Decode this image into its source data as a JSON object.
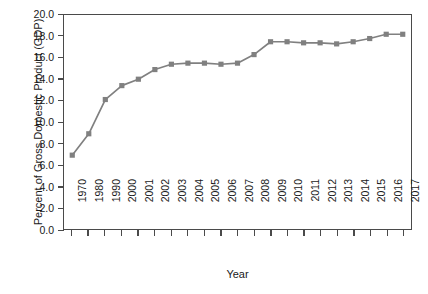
{
  "chart_data": {
    "type": "line",
    "title": "",
    "xlabel": "Year",
    "ylabel": "Percent of Gross Domestic Product (GDP)",
    "ylim": [
      0.0,
      20.0
    ],
    "ytick_step": 2.0,
    "ytick_labels": [
      "20.0",
      "18.0",
      "16.0",
      "14.0",
      "12.0",
      "10.0",
      "8.0",
      "6.0",
      "4.0",
      "2.0",
      "0.0"
    ],
    "grid": false,
    "legend": "none",
    "marker": "square",
    "series_color": "#808080",
    "axis_color": "#4a4a4a",
    "categories": [
      "1970",
      "1980",
      "1990",
      "2000",
      "2001",
      "2002",
      "2003",
      "2004",
      "2005",
      "2006",
      "2007",
      "2008",
      "2009",
      "2010",
      "2011",
      "2012",
      "2013",
      "2014",
      "2015",
      "2016",
      "2017"
    ],
    "values": [
      6.9,
      8.9,
      12.1,
      13.4,
      14.0,
      14.9,
      15.4,
      15.5,
      15.5,
      15.4,
      15.5,
      16.3,
      17.5,
      17.5,
      17.4,
      17.4,
      17.3,
      17.5,
      17.8,
      18.2,
      18.2
    ],
    "series": [
      {
        "name": "Percent of Gross Domestic Product (GDP)",
        "values": [
          6.9,
          8.9,
          12.1,
          13.4,
          14.0,
          14.9,
          15.4,
          15.5,
          15.5,
          15.4,
          15.5,
          16.3,
          17.5,
          17.5,
          17.4,
          17.4,
          17.3,
          17.5,
          17.8,
          18.2,
          18.2
        ]
      }
    ]
  },
  "caption": ""
}
